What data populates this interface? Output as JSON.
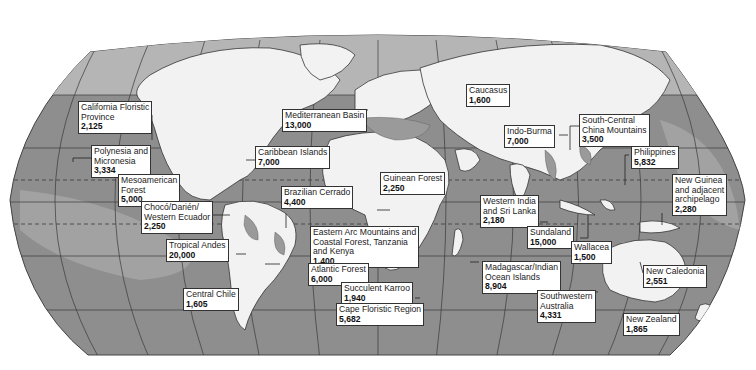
{
  "map": {
    "title": "Biodiversity Hotspots",
    "projection": "Robinson",
    "colors": {
      "ocean": "#8e8e8e",
      "ocean_light": "#b4b4b4",
      "land": "#f2f2f2",
      "hotspot": "#9a9a9a",
      "border": "#333333",
      "label_bg": "#ffffff"
    },
    "hotspots": [
      {
        "name": "California Floristic Province",
        "value": "2,125"
      },
      {
        "name": "Polynesia and Micronesia",
        "value": "3,334"
      },
      {
        "name": "Mesoamerican Forest",
        "value": "5,000"
      },
      {
        "name": "Chocó/Darién/ Western Ecuador",
        "value": "2,250"
      },
      {
        "name": "Tropical Andes",
        "value": "20,000"
      },
      {
        "name": "Central Chile",
        "value": "1,605"
      },
      {
        "name": "Caribbean Islands",
        "value": "7,000"
      },
      {
        "name": "Mediterranean Basin",
        "value": "13,000"
      },
      {
        "name": "Brazilian Cerrado",
        "value": "4,400"
      },
      {
        "name": "Guinean Forest",
        "value": "2,250"
      },
      {
        "name": "Eastern Arc Mountains and Coastal Forest, Tanzania and Kenya",
        "value": "1,400"
      },
      {
        "name": "Atlantic Forest",
        "value": "6,000"
      },
      {
        "name": "Succulent Karroo",
        "value": "1,940"
      },
      {
        "name": "Cape Floristic Region",
        "value": "5,682"
      },
      {
        "name": "Caucasus",
        "value": "1,600"
      },
      {
        "name": "Indo-Burma",
        "value": "7,000"
      },
      {
        "name": "South-Central China Mountains",
        "value": "3,500"
      },
      {
        "name": "Philippines",
        "value": "5,832"
      },
      {
        "name": "New Guinea and adjacent archipelago",
        "value": "2,280"
      },
      {
        "name": "Western India and Sri Lanka",
        "value": "2,180"
      },
      {
        "name": "Sundaland",
        "value": "15,000"
      },
      {
        "name": "Wallacea",
        "value": "1,500"
      },
      {
        "name": "Madagascar/Indian Ocean Islands",
        "value": "8,904"
      },
      {
        "name": "Southwestern Australia",
        "value": "4,331"
      },
      {
        "name": "New Caledonia",
        "value": "2,551"
      },
      {
        "name": "New Zealand",
        "value": "1,865"
      }
    ],
    "labels": {
      "cal_1": "California Floristic",
      "cal_2": "Province",
      "poly_1": "Polynesia and",
      "poly_2": "Micronesia",
      "meso_1": "Mesoamerican",
      "meso_2": "Forest",
      "choco_1": "Chocó/Darién/",
      "choco_2": "Western Ecuador",
      "andes_1": "Tropical Andes",
      "chile_1": "Central Chile",
      "carib_1": "Caribbean Islands",
      "med_1": "Mediterranean Basin",
      "cerr_1": "Brazilian Cerrado",
      "guin_1": "Guinean Forest",
      "earc_1": "Eastern Arc Mountains and",
      "earc_2": "Coastal Forest, Tanzania",
      "earc_3": "and Kenya",
      "atl_1": "Atlantic Forest",
      "karr_1": "Succulent Karroo",
      "cape_1": "Cape Floristic Region",
      "cauc_1": "Caucasus",
      "indo_1": "Indo-Burma",
      "scc_1": "South-Central",
      "scc_2": "China Mountains",
      "phil_1": "Philippines",
      "ng_1": "New Guinea",
      "ng_2": "and adjacent",
      "ng_3": "archipelago",
      "wind_1": "Western India",
      "wind_2": "and Sri Lanka",
      "sund_1": "Sundaland",
      "wall_1": "Wallacea",
      "mad_1": "Madagascar/Indian",
      "mad_2": "Ocean Islands",
      "swa_1": "Southwestern",
      "swa_2": "Australia",
      "ncal_1": "New Caledonia",
      "nz_1": "New Zealand"
    },
    "values": {
      "cal": "2,125",
      "poly": "3,334",
      "meso": "5,000",
      "choco": "2,250",
      "andes": "20,000",
      "chile": "1,605",
      "carib": "7,000",
      "med": "13,000",
      "cerr": "4,400",
      "guin": "2,250",
      "earc": "1,400",
      "atl": "6,000",
      "karr": "1,940",
      "cape": "5,682",
      "cauc": "1,600",
      "indo": "7,000",
      "scc": "3,500",
      "phil": "5,832",
      "ng": "2,280",
      "wind": "2,180",
      "sund": "15,000",
      "wall": "1,500",
      "mad": "8,904",
      "swa": "4,331",
      "ncal": "2,551",
      "nz": "1,865"
    }
  }
}
